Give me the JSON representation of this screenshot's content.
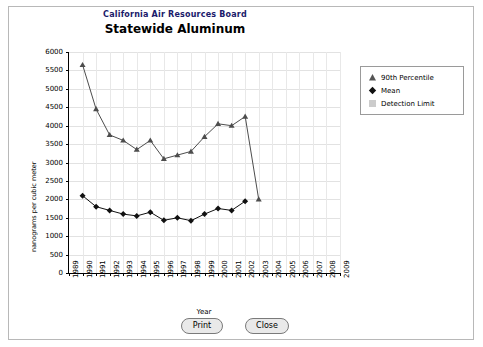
{
  "window": {
    "print_label": "Print",
    "close_label": "Close"
  },
  "header": {
    "agency": "California Air Resources Board",
    "title": "Statewide Aluminum"
  },
  "legend": {
    "items": [
      {
        "label": "90th Percentile",
        "symbol": "triangle",
        "color": "#555555"
      },
      {
        "label": "Mean",
        "symbol": "diamond",
        "color": "#111111"
      },
      {
        "label": "Detection Limit",
        "symbol": "square",
        "color": "#cccccc"
      }
    ]
  },
  "chart_data": {
    "type": "line",
    "title": "Statewide Aluminum",
    "subtitle": "California Air Resources Board",
    "xlabel": "Year",
    "ylabel": "nanograms per cubic meter",
    "xlim": [
      1989,
      2009
    ],
    "ylim": [
      0,
      6000
    ],
    "ytick_labels": [
      "0",
      "500",
      "1000",
      "1500",
      "2000",
      "2500",
      "3000",
      "3500",
      "4000",
      "4500",
      "5000",
      "5500",
      "6000"
    ],
    "xtick_labels": [
      "1989",
      "1990",
      "1991",
      "1992",
      "1993",
      "1994",
      "1995",
      "1996",
      "1997",
      "1998",
      "1999",
      "2000",
      "2001",
      "2002",
      "2003",
      "2004",
      "2005",
      "2006",
      "2007",
      "2008",
      "2009"
    ],
    "grid": true,
    "legend_position": "right",
    "x": [
      1990,
      1991,
      1992,
      1993,
      1994,
      1995,
      1996,
      1997,
      1998,
      1999,
      2000,
      2001,
      2002,
      2003
    ],
    "series": [
      {
        "name": "90th Percentile",
        "symbol": "triangle",
        "values": [
          5650,
          4450,
          3750,
          3600,
          3350,
          3600,
          3100,
          3200,
          3300,
          3700,
          4050,
          4000,
          4250,
          2000
        ]
      },
      {
        "name": "Mean",
        "symbol": "diamond",
        "values": [
          2100,
          1800,
          1700,
          1600,
          1550,
          1650,
          1430,
          1500,
          1420,
          1600,
          1750,
          1700,
          1950,
          null
        ]
      }
    ]
  }
}
